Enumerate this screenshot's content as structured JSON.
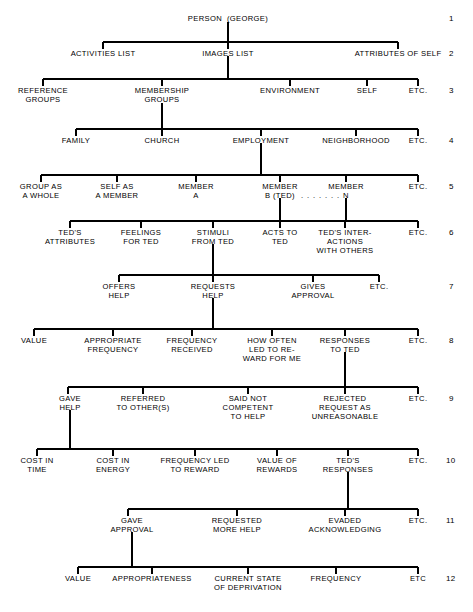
{
  "diagram": {
    "type": "tree",
    "width": 473,
    "height": 612,
    "line_color": "#000000",
    "text_color": "#000000",
    "background": "#ffffff",
    "row_numbers": [
      "1",
      "2",
      "3",
      "4",
      "5",
      "6",
      "7",
      "8",
      "9",
      "10",
      "11",
      "12"
    ],
    "dot_leader": ". . . . . . .",
    "levels": [
      {
        "level": 1,
        "number": "1",
        "y": 18,
        "nodes": [
          {
            "id": "person",
            "label": "PERSON  (GEORGE)",
            "x": 228,
            "lines": [
              "PERSON  (GEORGE)"
            ]
          }
        ]
      },
      {
        "level": 2,
        "number": "2",
        "y": 53,
        "nodes": [
          {
            "id": "activities-list",
            "label": "ACTIVITIES LIST",
            "x": 103,
            "lines": [
              "ACTIVITIES LIST"
            ]
          },
          {
            "id": "images-list",
            "label": "IMAGES LIST",
            "x": 228,
            "lines": [
              "IMAGES LIST"
            ]
          },
          {
            "id": "attributes-of-self",
            "label": "ATTRIBUTES OF SELF",
            "x": 398,
            "lines": [
              "ATTRIBUTES OF SELF"
            ]
          }
        ]
      },
      {
        "level": 3,
        "number": "3",
        "y": 90,
        "nodes": [
          {
            "id": "reference-groups",
            "label": "REFERENCE GROUPS",
            "x": 43,
            "lines": [
              "REFERENCE",
              "GROUPS"
            ]
          },
          {
            "id": "membership-groups",
            "label": "MEMBERSHIP GROUPS",
            "x": 162,
            "lines": [
              "MEMBERSHIP",
              "GROUPS"
            ]
          },
          {
            "id": "environment",
            "label": "ENVIRONMENT",
            "x": 290,
            "lines": [
              "ENVIRONMENT"
            ]
          },
          {
            "id": "self",
            "label": "SELF",
            "x": 367,
            "lines": [
              "SELF"
            ]
          },
          {
            "id": "etc-3",
            "label": "ETC.",
            "x": 418,
            "lines": [
              "ETC."
            ]
          }
        ]
      },
      {
        "level": 4,
        "number": "4",
        "y": 140,
        "nodes": [
          {
            "id": "family",
            "label": "FAMILY",
            "x": 76,
            "lines": [
              "FAMILY"
            ]
          },
          {
            "id": "church",
            "label": "CHURCH",
            "x": 162,
            "lines": [
              "CHURCH"
            ]
          },
          {
            "id": "employment",
            "label": "EMPLOYMENT",
            "x": 261,
            "lines": [
              "EMPLOYMENT"
            ]
          },
          {
            "id": "neighborhood",
            "label": "NEIGHBORHOOD",
            "x": 356,
            "lines": [
              "NEIGHBORHOOD"
            ]
          },
          {
            "id": "etc-4",
            "label": "ETC.",
            "x": 418,
            "lines": [
              "ETC."
            ]
          }
        ]
      },
      {
        "level": 5,
        "number": "5",
        "y": 186,
        "nodes": [
          {
            "id": "group-as-a-whole",
            "label": "GROUP AS A WHOLE",
            "x": 41,
            "lines": [
              "GROUP AS",
              "A WHOLE"
            ]
          },
          {
            "id": "self-as-a-member",
            "label": "SELF AS A MEMBER",
            "x": 117,
            "lines": [
              "SELF AS",
              "A MEMBER"
            ]
          },
          {
            "id": "member-a",
            "label": "MEMBER A",
            "x": 196,
            "lines": [
              "MEMBER",
              "A"
            ]
          },
          {
            "id": "member-b-ted",
            "label": "MEMBER B (TED)",
            "x": 280,
            "lines": [
              "MEMBER",
              "B (TED)"
            ]
          },
          {
            "id": "member-n",
            "label": "MEMBER N",
            "x": 346,
            "lines": [
              "MEMBER",
              "N"
            ]
          },
          {
            "id": "etc-5",
            "label": "ETC.",
            "x": 418,
            "lines": [
              "ETC."
            ]
          }
        ]
      },
      {
        "level": 6,
        "number": "6",
        "y": 232,
        "nodes": [
          {
            "id": "teds-attributes",
            "label": "TED'S ATTRIBUTES",
            "x": 70,
            "lines": [
              "TED'S",
              "ATTRIBUTES"
            ]
          },
          {
            "id": "feelings-for-ted",
            "label": "FEELINGS FOR TED",
            "x": 141,
            "lines": [
              "FEELINGS",
              "FOR TED"
            ]
          },
          {
            "id": "stimuli-from-ted",
            "label": "STIMULI FROM TED",
            "x": 213,
            "lines": [
              "STIMULI",
              "FROM TED"
            ]
          },
          {
            "id": "acts-to-ted",
            "label": "ACTS TO TED",
            "x": 280,
            "lines": [
              "ACTS TO",
              "TED"
            ]
          },
          {
            "id": "teds-interactions-with-others",
            "label": "TED'S INTER-ACTIONS WITH OTHERS",
            "x": 345,
            "lines": [
              "TED'S INTER-",
              "ACTIONS",
              "WITH OTHERS"
            ]
          },
          {
            "id": "etc-6",
            "label": "ETC.",
            "x": 418,
            "lines": [
              "ETC."
            ]
          }
        ]
      },
      {
        "level": 7,
        "number": "7",
        "y": 286,
        "nodes": [
          {
            "id": "offers-help",
            "label": "OFFERS HELP",
            "x": 119,
            "lines": [
              "OFFERS",
              "HELP"
            ]
          },
          {
            "id": "requests-help",
            "label": "REQUESTS HELP",
            "x": 213,
            "lines": [
              "REQUESTS",
              "HELP"
            ]
          },
          {
            "id": "gives-approval",
            "label": "GIVES APPROVAL",
            "x": 313,
            "lines": [
              "GIVES",
              "APPROVAL"
            ]
          },
          {
            "id": "etc-7",
            "label": "ETC.",
            "x": 379,
            "lines": [
              "ETC."
            ]
          }
        ]
      },
      {
        "level": 8,
        "number": "8",
        "y": 340,
        "nodes": [
          {
            "id": "value-8",
            "label": "VALUE",
            "x": 34,
            "lines": [
              "VALUE"
            ]
          },
          {
            "id": "appropriate-frequency",
            "label": "APPROPRIATE FREQUENCY",
            "x": 113,
            "lines": [
              "APPROPRIATE",
              "FREQUENCY"
            ]
          },
          {
            "id": "frequency-received",
            "label": "FREQUENCY RECEIVED",
            "x": 192,
            "lines": [
              "FREQUENCY",
              "RECEIVED"
            ]
          },
          {
            "id": "how-often-led-to-reward-for-me",
            "label": "HOW OFTEN LED TO REWARD FOR ME",
            "x": 272,
            "lines": [
              "HOW OFTEN",
              "LED TO RE-",
              "WARD FOR ME"
            ]
          },
          {
            "id": "responses-to-ted",
            "label": "RESPONSES TO TED",
            "x": 345,
            "lines": [
              "RESPONSES",
              "TO TED"
            ]
          },
          {
            "id": "etc-8",
            "label": "ETC.",
            "x": 418,
            "lines": [
              "ETC."
            ]
          }
        ]
      },
      {
        "level": 9,
        "number": "9",
        "y": 398,
        "nodes": [
          {
            "id": "gave-help",
            "label": "GAVE HELP",
            "x": 70,
            "lines": [
              "GAVE",
              "HELP"
            ]
          },
          {
            "id": "referred-to-others",
            "label": "REFERRED TO OTHER(S)",
            "x": 143,
            "lines": [
              "REFERRED",
              "TO OTHER(S)"
            ]
          },
          {
            "id": "said-not-competent-to-help",
            "label": "SAID NOT COMPETENT TO HELP",
            "x": 248,
            "lines": [
              "SAID NOT",
              "COMPETENT",
              "TO HELP"
            ]
          },
          {
            "id": "rejected-request-as-unreasonable",
            "label": "REJECTED REQUEST AS UNREASONABLE",
            "x": 345,
            "lines": [
              "REJECTED",
              "REQUEST AS",
              "UNREASONABLE"
            ]
          },
          {
            "id": "etc-9",
            "label": "ETC.",
            "x": 418,
            "lines": [
              "ETC."
            ]
          }
        ]
      },
      {
        "level": 10,
        "number": "10",
        "y": 460,
        "nodes": [
          {
            "id": "cost-in-time",
            "label": "COST IN TIME",
            "x": 37,
            "lines": [
              "COST IN",
              "TIME"
            ]
          },
          {
            "id": "cost-in-energy",
            "label": "COST IN ENERGY",
            "x": 113,
            "lines": [
              "COST IN",
              "ENERGY"
            ]
          },
          {
            "id": "frequency-led-to-reward",
            "label": "FREQUENCY LED TO REWARD",
            "x": 195,
            "lines": [
              "FREQUENCY LED",
              "TO REWARD"
            ]
          },
          {
            "id": "value-of-rewards",
            "label": "VALUE OF REWARDS",
            "x": 277,
            "lines": [
              "VALUE OF",
              "REWARDS"
            ]
          },
          {
            "id": "teds-responses",
            "label": "TED'S RESPONSES",
            "x": 348,
            "lines": [
              "TED'S",
              "RESPONSES"
            ]
          },
          {
            "id": "etc-10",
            "label": "ETC.",
            "x": 418,
            "lines": [
              "ETC."
            ]
          }
        ]
      },
      {
        "level": 11,
        "number": "11",
        "y": 520,
        "nodes": [
          {
            "id": "gave-approval",
            "label": "GAVE APPROVAL",
            "x": 132,
            "lines": [
              "GAVE",
              "APPROVAL"
            ]
          },
          {
            "id": "requested-more-help",
            "label": "REQUESTED MORE HELP",
            "x": 237,
            "lines": [
              "REQUESTED",
              "MORE HELP"
            ]
          },
          {
            "id": "evaded-acknowledging",
            "label": "EVADED ACKNOWLEDGING",
            "x": 345,
            "lines": [
              "EVADED",
              "ACKNOWLEDGING"
            ]
          },
          {
            "id": "etc-11",
            "label": "ETC.",
            "x": 418,
            "lines": [
              "ETC."
            ]
          }
        ]
      },
      {
        "level": 12,
        "number": "12",
        "y": 578,
        "nodes": [
          {
            "id": "value-12",
            "label": "VALUE",
            "x": 78,
            "lines": [
              "VALUE"
            ]
          },
          {
            "id": "appropriateness",
            "label": "APPROPRIATENESS",
            "x": 152,
            "lines": [
              "APPROPRIATENESS"
            ]
          },
          {
            "id": "current-state-of-deprivation",
            "label": "CURRENT STATE OF DEPRIVATION",
            "x": 248,
            "lines": [
              "CURRENT STATE",
              "OF DEPRIVATION"
            ]
          },
          {
            "id": "frequency-12",
            "label": "FREQUENCY",
            "x": 336,
            "lines": [
              "FREQUENCY"
            ]
          },
          {
            "id": "etc-12",
            "label": "ETC",
            "x": 418,
            "lines": [
              "ETC"
            ]
          }
        ]
      }
    ]
  }
}
